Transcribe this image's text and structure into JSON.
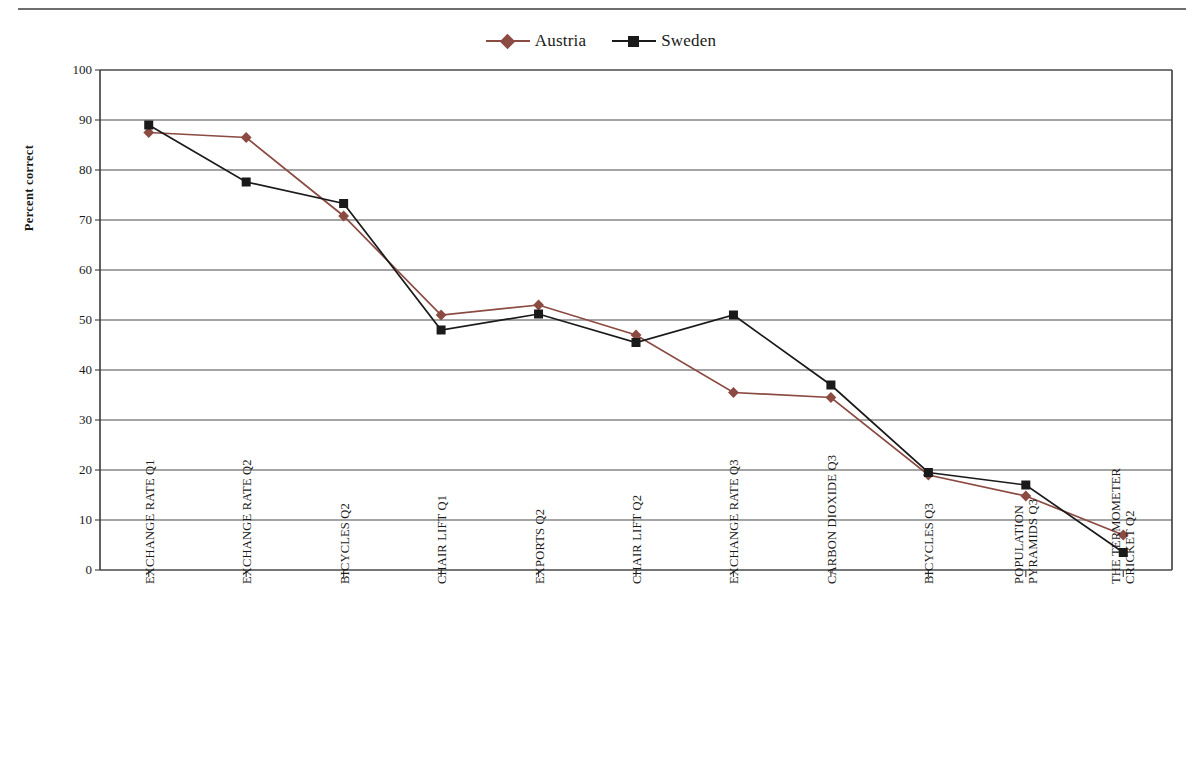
{
  "legend": {
    "position": "top-center",
    "entries": [
      {
        "label": "Austria",
        "color": "#8b4a42",
        "marker": "diamond"
      },
      {
        "label": "Sweden",
        "color": "#1a1a1a",
        "marker": "square"
      }
    ]
  },
  "axis": {
    "ylabel": "Percent correct",
    "yticks": [
      "0",
      "10",
      "20",
      "30",
      "40",
      "50",
      "60",
      "70",
      "80",
      "90",
      "100"
    ]
  },
  "chart_data": {
    "type": "line",
    "title": "",
    "xlabel": "",
    "ylabel": "Percent correct",
    "ylim": [
      0,
      100
    ],
    "ytick_step": 10,
    "grid": "horizontal",
    "legend_position": "top-center",
    "categories": [
      "EXCHANGE RATE Q1",
      "EXCHANGE RATE Q2",
      "BICYCLES Q2",
      "CHAIR LIFT Q1",
      "EXPORTS Q2",
      "CHAIR LIFT Q2",
      "EXCHANGE RATE Q3",
      "CARBON DIOXIDE Q3",
      "BICYCLES Q3",
      "POPULATION PYRAMIDS Q3",
      "THE TERMOMETER CRICKET Q2"
    ],
    "category_lines": [
      [
        "EXCHANGE RATE Q1"
      ],
      [
        "EXCHANGE RATE Q2"
      ],
      [
        "BICYCLES Q2"
      ],
      [
        "CHAIR LIFT Q1"
      ],
      [
        "EXPORTS Q2"
      ],
      [
        "CHAIR LIFT Q2"
      ],
      [
        "EXCHANGE RATE Q3"
      ],
      [
        "CARBON DIOXIDE Q3"
      ],
      [
        "BICYCLES Q3"
      ],
      [
        "POPULATION",
        "PYRAMIDS Q3"
      ],
      [
        "THE TERMOMETER",
        "CRICKET Q2"
      ]
    ],
    "series": [
      {
        "name": "Austria",
        "color": "#8b4a42",
        "marker": "diamond",
        "values": [
          87.5,
          86.5,
          70.8,
          51.0,
          53.0,
          47.0,
          35.5,
          34.5,
          19.0,
          14.8,
          7.0
        ]
      },
      {
        "name": "Sweden",
        "color": "#1a1a1a",
        "marker": "square",
        "values": [
          89.0,
          77.6,
          73.3,
          48.0,
          51.2,
          45.5,
          51.0,
          37.0,
          19.5,
          17.0,
          3.5
        ]
      }
    ]
  }
}
